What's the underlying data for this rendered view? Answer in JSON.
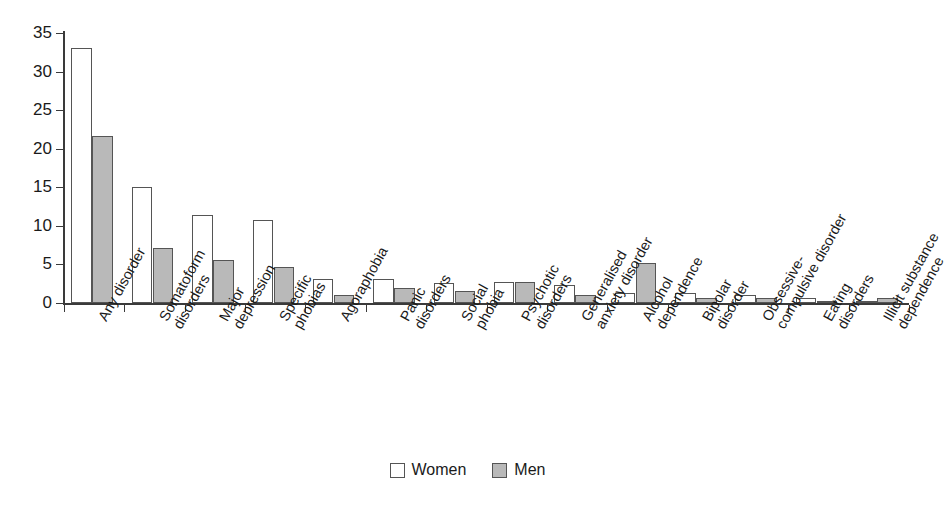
{
  "chart_data": {
    "type": "bar",
    "title": "",
    "subtitle": "",
    "xlabel": "",
    "ylabel": "",
    "ylim": [
      0,
      35
    ],
    "yticks": [
      0,
      5,
      10,
      15,
      20,
      25,
      30,
      35
    ],
    "grid": false,
    "legend_position": "bottom-center",
    "categories": [
      "Any disorder",
      "Somatoform disorders",
      "Major depression",
      "Specific phobias",
      "Agoraphobia",
      "Panic disorders",
      "Social phobia",
      "Psychotic disorders",
      "Generalised anxiety disorder",
      "Alcohol dependence",
      "Bipolar disorder",
      "Obsessive-compulsive disorder",
      "Eating disorders",
      "Illicit substance dependence"
    ],
    "category_lines": [
      [
        "Any disorder",
        ""
      ],
      [
        "Somatoform",
        "disorders"
      ],
      [
        "Major",
        "depression"
      ],
      [
        "Specific",
        "phobias"
      ],
      [
        "Agoraphobia",
        ""
      ],
      [
        "Panic",
        "disorders"
      ],
      [
        "Social",
        "phobia"
      ],
      [
        "Psychotic",
        "disorders"
      ],
      [
        "Generalised",
        "anxiety disorder"
      ],
      [
        "Alcohol",
        "dependence"
      ],
      [
        "Bipolar",
        "disorder"
      ],
      [
        "Obsessive-",
        "compulsive disorder"
      ],
      [
        "Eating",
        "disorders"
      ],
      [
        "Illicit substance",
        "dependence"
      ]
    ],
    "series": [
      {
        "name": "Women",
        "color": "#ffffff",
        "values": [
          33.1,
          15.0,
          11.4,
          10.7,
          3.1,
          3.1,
          2.6,
          2.7,
          2.3,
          1.3,
          1.3,
          1.1,
          0.6,
          0.1
        ]
      },
      {
        "name": "Men",
        "color": "#b9b9b9",
        "values": [
          21.7,
          7.1,
          5.6,
          4.7,
          1.1,
          1.9,
          1.6,
          2.7,
          1.1,
          5.2,
          0.7,
          0.7,
          0.3,
          0.6
        ]
      }
    ]
  },
  "legend": {
    "entries": [
      {
        "label": "Women",
        "swatch": "white-square"
      },
      {
        "label": "Men",
        "swatch": "gray-square"
      }
    ]
  }
}
